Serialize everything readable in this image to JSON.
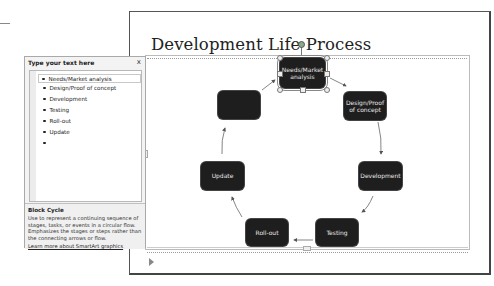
{
  "slide": {
    "title": "Development Life Process"
  },
  "smartart": {
    "layout": "Block Cycle",
    "nodes": [
      {
        "label": "Needs/Market analysis",
        "selected": true
      },
      {
        "label": "Design/Proof of concept",
        "selected": false
      },
      {
        "label": "Development",
        "selected": false
      },
      {
        "label": "Testing",
        "selected": false
      },
      {
        "label": "Roll-out",
        "selected": false
      },
      {
        "label": "Update",
        "selected": false
      },
      {
        "label": "",
        "selected": false
      }
    ],
    "node_color": "#1e1e1e",
    "node_text_color": "#e8e8e8"
  },
  "text_pane": {
    "title": "Type your text here",
    "close_label": "x",
    "items": [
      "Needs/Market analysis",
      "Design/Proof of concept",
      "Development",
      "Testing",
      "Roll-out",
      "Update",
      ""
    ],
    "description": {
      "title": "Block Cycle",
      "text": "Use to represent a continuing sequence of stages, tasks, or events in a circular flow. Emphasizes the stages or steps rather than the connecting arrows or flow.",
      "link": "Learn more about SmartArt graphics"
    }
  }
}
